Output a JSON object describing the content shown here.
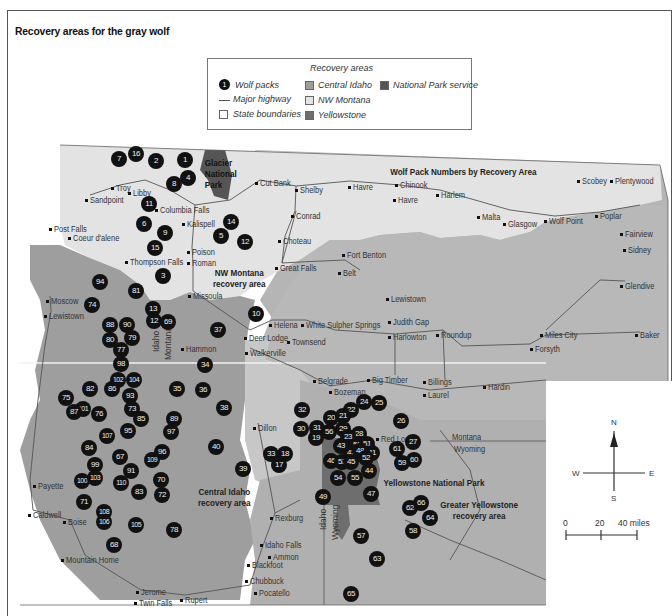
{
  "title": "Recovery areas for the gray wolf",
  "legend": {
    "header": "Recovery areas",
    "wolf_packs": "Wolf packs",
    "wolf_pack_sample": "1",
    "major_highway": "Major highway",
    "state_boundaries": "State boundaries",
    "central_idaho": "Central Idaho",
    "nw_montana": "NW Montana",
    "yellowstone": "Yellowstone",
    "national_park_service": "National Park service"
  },
  "colors": {
    "central_idaho": "#9e9e9e",
    "nw_montana": "#e3e3e3",
    "yellowstone": "#6e6e6e",
    "national_park_service": "#555555",
    "background_region": "#b5b5b5",
    "pack_marker": "#111111"
  },
  "map": {
    "subtitle": "Wolf Pack Numbers by Recovery Area",
    "area_labels": {
      "nw_montana": "NW Montana\nrecovery area",
      "central_idaho": "Central Idaho\nrecovery area",
      "greater_yellowstone": "Greater Yellowstone\nrecovery area",
      "glacier": "Glacier\nNational\nPark",
      "yellowstone_np": "Yellowstone National Park"
    },
    "state_labels": {
      "idaho": "Idaho",
      "montana": "Montana",
      "montana2": "Montana",
      "wyoming": "Wyoming",
      "idaho2": "Idaho",
      "wyoming2": "Wyoming"
    },
    "cities": [
      {
        "name": "Troy",
        "x": 116,
        "y": 183
      },
      {
        "name": "Libby",
        "x": 133,
        "y": 188
      },
      {
        "name": "Sandpoint",
        "x": 90,
        "y": 195
      },
      {
        "name": "Columbia Falls",
        "x": 160,
        "y": 205
      },
      {
        "name": "Kalispell",
        "x": 187,
        "y": 219
      },
      {
        "name": "Post Falls",
        "x": 54,
        "y": 224
      },
      {
        "name": "Coeur d'alene",
        "x": 73,
        "y": 233
      },
      {
        "name": "Poison",
        "x": 192,
        "y": 247
      },
      {
        "name": "Roman",
        "x": 192,
        "y": 258
      },
      {
        "name": "Thompson Falls",
        "x": 130,
        "y": 257
      },
      {
        "name": "Cut Bank",
        "x": 260,
        "y": 178
      },
      {
        "name": "Shelby",
        "x": 300,
        "y": 185
      },
      {
        "name": "Havre",
        "x": 353,
        "y": 182
      },
      {
        "name": "Chinook",
        "x": 400,
        "y": 180
      },
      {
        "name": "Havre",
        "x": 398,
        "y": 195
      },
      {
        "name": "Harlem",
        "x": 441,
        "y": 190
      },
      {
        "name": "Conrad",
        "x": 296,
        "y": 211
      },
      {
        "name": "Choteau",
        "x": 283,
        "y": 236
      },
      {
        "name": "Malta",
        "x": 482,
        "y": 212
      },
      {
        "name": "Glasgow",
        "x": 508,
        "y": 219
      },
      {
        "name": "Wolf Point",
        "x": 549,
        "y": 216
      },
      {
        "name": "Poplar",
        "x": 600,
        "y": 211
      },
      {
        "name": "Scobey",
        "x": 582,
        "y": 176
      },
      {
        "name": "Plentywood",
        "x": 615,
        "y": 176
      },
      {
        "name": "Fairview",
        "x": 625,
        "y": 229
      },
      {
        "name": "Sidney",
        "x": 628,
        "y": 245
      },
      {
        "name": "Fort Benton",
        "x": 347,
        "y": 250
      },
      {
        "name": "Great Falls",
        "x": 280,
        "y": 263
      },
      {
        "name": "Belt",
        "x": 343,
        "y": 268
      },
      {
        "name": "Missoula",
        "x": 193,
        "y": 291
      },
      {
        "name": "Lewistown",
        "x": 391,
        "y": 294
      },
      {
        "name": "Glendive",
        "x": 625,
        "y": 281
      },
      {
        "name": "Judith Gap",
        "x": 393,
        "y": 317
      },
      {
        "name": "Helena",
        "x": 274,
        "y": 320
      },
      {
        "name": "White Sulpher Springs",
        "x": 306,
        "y": 320
      },
      {
        "name": "Townsend",
        "x": 292,
        "y": 337
      },
      {
        "name": "Harlowton",
        "x": 393,
        "y": 332
      },
      {
        "name": "Roundup",
        "x": 441,
        "y": 330
      },
      {
        "name": "Deer Lodge",
        "x": 249,
        "y": 333
      },
      {
        "name": "Walkerville",
        "x": 250,
        "y": 348
      },
      {
        "name": "Hammon",
        "x": 186,
        "y": 344
      },
      {
        "name": "Miles City",
        "x": 545,
        "y": 330
      },
      {
        "name": "Forsyth",
        "x": 535,
        "y": 344
      },
      {
        "name": "Baker",
        "x": 640,
        "y": 330
      },
      {
        "name": "Moscow",
        "x": 51,
        "y": 296
      },
      {
        "name": "Lewistown",
        "x": 49,
        "y": 311
      },
      {
        "name": "Belgrade",
        "x": 318,
        "y": 376
      },
      {
        "name": "Bozeman",
        "x": 334,
        "y": 387
      },
      {
        "name": "Big Timber",
        "x": 372,
        "y": 375
      },
      {
        "name": "Billings",
        "x": 428,
        "y": 377
      },
      {
        "name": "Laurel",
        "x": 428,
        "y": 390
      },
      {
        "name": "Hardin",
        "x": 488,
        "y": 382
      },
      {
        "name": "Dillon",
        "x": 258,
        "y": 423
      },
      {
        "name": "Red Lodge",
        "x": 381,
        "y": 434
      },
      {
        "name": "Payette",
        "x": 38,
        "y": 481
      },
      {
        "name": "Caldwell",
        "x": 33,
        "y": 510
      },
      {
        "name": "Boise",
        "x": 68,
        "y": 517
      },
      {
        "name": "Mountain Home",
        "x": 66,
        "y": 555
      },
      {
        "name": "Rexburg",
        "x": 275,
        "y": 513
      },
      {
        "name": "Idaho Falls",
        "x": 265,
        "y": 540
      },
      {
        "name": "Ammon",
        "x": 273,
        "y": 552
      },
      {
        "name": "Blackfoot",
        "x": 252,
        "y": 560
      },
      {
        "name": "Chubbuck",
        "x": 250,
        "y": 576
      },
      {
        "name": "Pocatello",
        "x": 259,
        "y": 588
      },
      {
        "name": "Jerome",
        "x": 141,
        "y": 587
      },
      {
        "name": "Twin Falls",
        "x": 139,
        "y": 598
      },
      {
        "name": "Rupert",
        "x": 185,
        "y": 595
      }
    ],
    "packs": [
      {
        "n": "7",
        "x": 119,
        "y": 159
      },
      {
        "n": "16",
        "x": 136,
        "y": 154
      },
      {
        "n": "2",
        "x": 156,
        "y": 161
      },
      {
        "n": "1",
        "x": 185,
        "y": 160
      },
      {
        "n": "4",
        "x": 188,
        "y": 178
      },
      {
        "n": "8",
        "x": 174,
        "y": 184
      },
      {
        "name": "",
        "n": "11",
        "x": 149,
        "y": 204
      },
      {
        "n": "6",
        "x": 144,
        "y": 224
      },
      {
        "n": "9",
        "x": 165,
        "y": 233
      },
      {
        "n": "15",
        "x": 155,
        "y": 248
      },
      {
        "n": "14",
        "x": 231,
        "y": 222
      },
      {
        "n": "5",
        "x": 221,
        "y": 236
      },
      {
        "n": "12",
        "x": 245,
        "y": 242
      },
      {
        "n": "3",
        "x": 163,
        "y": 276
      },
      {
        "n": "94",
        "x": 100,
        "y": 282
      },
      {
        "n": "81",
        "x": 136,
        "y": 291
      },
      {
        "n": "74",
        "x": 92,
        "y": 305
      },
      {
        "n": "13",
        "x": 153,
        "y": 309
      },
      {
        "n": "12",
        "x": 154,
        "y": 321
      },
      {
        "n": "69",
        "x": 168,
        "y": 322
      },
      {
        "n": "10",
        "x": 256,
        "y": 314
      },
      {
        "n": "88",
        "x": 110,
        "y": 325
      },
      {
        "n": "90",
        "x": 127,
        "y": 325
      },
      {
        "n": "79",
        "x": 132,
        "y": 338
      },
      {
        "n": "80",
        "x": 110,
        "y": 340
      },
      {
        "n": "77",
        "x": 121,
        "y": 350
      },
      {
        "n": "98",
        "x": 121,
        "y": 364
      },
      {
        "n": "37",
        "x": 218,
        "y": 330
      },
      {
        "n": "34",
        "x": 205,
        "y": 365
      },
      {
        "n": "102",
        "x": 118,
        "y": 380
      },
      {
        "n": "104",
        "x": 134,
        "y": 380
      },
      {
        "n": "82",
        "x": 90,
        "y": 389
      },
      {
        "n": "86",
        "x": 112,
        "y": 389
      },
      {
        "n": "75",
        "x": 66,
        "y": 398
      },
      {
        "n": "93",
        "x": 130,
        "y": 396
      },
      {
        "n": "35",
        "x": 177,
        "y": 389
      },
      {
        "n": "36",
        "x": 203,
        "y": 390
      },
      {
        "n": "101",
        "x": 83,
        "y": 409
      },
      {
        "n": "87",
        "x": 74,
        "y": 412
      },
      {
        "n": "76",
        "x": 99,
        "y": 414
      },
      {
        "n": "73",
        "x": 132,
        "y": 409
      },
      {
        "n": "85",
        "x": 141,
        "y": 419
      },
      {
        "n": "38",
        "x": 224,
        "y": 408
      },
      {
        "n": "89",
        "x": 174,
        "y": 419
      },
      {
        "n": "97",
        "x": 171,
        "y": 432
      },
      {
        "n": "95",
        "x": 128,
        "y": 431
      },
      {
        "n": "107",
        "x": 107,
        "y": 436
      },
      {
        "n": "84",
        "x": 89,
        "y": 448
      },
      {
        "n": "40",
        "x": 216,
        "y": 447
      },
      {
        "n": "67",
        "x": 120,
        "y": 457
      },
      {
        "n": "96",
        "x": 162,
        "y": 452
      },
      {
        "n": "109",
        "x": 152,
        "y": 460
      },
      {
        "n": "99",
        "x": 95,
        "y": 465
      },
      {
        "n": "91",
        "x": 131,
        "y": 471
      },
      {
        "n": "100",
        "x": 82,
        "y": 481
      },
      {
        "n": "103",
        "x": 95,
        "y": 478
      },
      {
        "n": "110",
        "x": 121,
        "y": 483
      },
      {
        "n": "70",
        "x": 161,
        "y": 480
      },
      {
        "n": "39",
        "x": 243,
        "y": 469
      },
      {
        "n": "83",
        "x": 139,
        "y": 492
      },
      {
        "n": "72",
        "x": 162,
        "y": 495
      },
      {
        "n": "71",
        "x": 84,
        "y": 502
      },
      {
        "n": "108",
        "x": 104,
        "y": 512
      },
      {
        "n": "106",
        "x": 104,
        "y": 522
      },
      {
        "n": "105",
        "x": 136,
        "y": 525
      },
      {
        "n": "78",
        "x": 174,
        "y": 530
      },
      {
        "n": "68",
        "x": 114,
        "y": 545
      },
      {
        "n": "32",
        "x": 302,
        "y": 410
      },
      {
        "n": "24",
        "x": 364,
        "y": 402
      },
      {
        "n": "25",
        "x": 379,
        "y": 403
      },
      {
        "n": "22",
        "x": 351,
        "y": 410
      },
      {
        "n": "20",
        "x": 331,
        "y": 418
      },
      {
        "n": "21",
        "x": 343,
        "y": 416
      },
      {
        "n": "26",
        "x": 401,
        "y": 421
      },
      {
        "n": "30",
        "x": 301,
        "y": 429
      },
      {
        "n": "31",
        "x": 317,
        "y": 428
      },
      {
        "name": "",
        "n": "29",
        "x": 343,
        "y": 429
      },
      {
        "n": "28",
        "x": 359,
        "y": 434
      },
      {
        "n": "56",
        "x": 329,
        "y": 432
      },
      {
        "n": "19",
        "x": 316,
        "y": 438
      },
      {
        "n": "23",
        "x": 348,
        "y": 437
      },
      {
        "n": "43",
        "x": 341,
        "y": 446
      },
      {
        "n": "50",
        "x": 357,
        "y": 445
      },
      {
        "n": "51",
        "x": 367,
        "y": 444
      },
      {
        "n": "61",
        "x": 397,
        "y": 449
      },
      {
        "n": "27",
        "x": 413,
        "y": 442
      },
      {
        "n": "42",
        "x": 351,
        "y": 453
      },
      {
        "n": "48",
        "x": 360,
        "y": 451
      },
      {
        "n": "41",
        "x": 372,
        "y": 453
      },
      {
        "n": "52",
        "x": 366,
        "y": 458
      },
      {
        "n": "46",
        "x": 331,
        "y": 461
      },
      {
        "n": "53",
        "x": 342,
        "y": 462
      },
      {
        "n": "45",
        "x": 351,
        "y": 462
      },
      {
        "n": "59",
        "x": 402,
        "y": 463
      },
      {
        "n": "60",
        "x": 414,
        "y": 460
      },
      {
        "n": "33",
        "x": 271,
        "y": 454
      },
      {
        "n": "18",
        "x": 285,
        "y": 454
      },
      {
        "n": "17",
        "x": 279,
        "y": 465
      },
      {
        "n": "44",
        "x": 369,
        "y": 471
      },
      {
        "n": "54",
        "x": 338,
        "y": 478
      },
      {
        "n": "55",
        "x": 355,
        "y": 478
      },
      {
        "n": "47",
        "x": 371,
        "y": 494
      },
      {
        "n": "49",
        "x": 323,
        "y": 497
      },
      {
        "n": "62",
        "x": 410,
        "y": 508
      },
      {
        "n": "66",
        "x": 421,
        "y": 503
      },
      {
        "n": "64",
        "x": 430,
        "y": 518
      },
      {
        "n": "58",
        "x": 413,
        "y": 531
      },
      {
        "n": "57",
        "x": 361,
        "y": 536
      },
      {
        "n": "63",
        "x": 377,
        "y": 559
      },
      {
        "n": "65",
        "x": 351,
        "y": 594
      }
    ]
  },
  "compass": {
    "n": "N",
    "s": "S",
    "e": "E",
    "w": "W"
  },
  "scale_bar": {
    "zero": "0",
    "mid": "20",
    "end": "40 miles"
  }
}
